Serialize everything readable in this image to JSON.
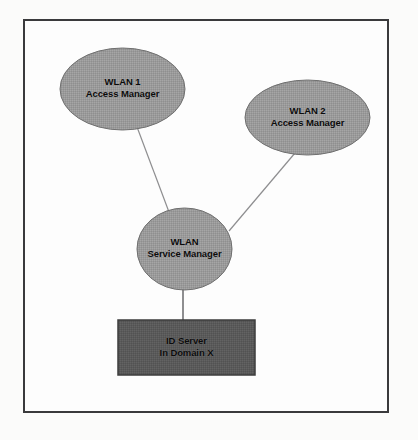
{
  "diagram": {
    "frame": {
      "border_color": "#3a3a3c",
      "background": "#fdfdfd"
    },
    "palette": {
      "ellipse_fill": "#9a9a9a",
      "ellipse_stroke": "#6f6f6f",
      "rect_fill": "#5a5a5a",
      "rect_stroke": "#3d3d3d",
      "connector": "#8e8e90",
      "text": "#0b0b0b"
    },
    "nodes": [
      {
        "id": "wlan1-access-manager",
        "shape": "ellipse",
        "line1": "WLAN 1",
        "line2": "Access Manager",
        "cx": 122.5,
        "cy": 89,
        "rx": 62.5,
        "ry": 41,
        "fill": "#9a9a9a"
      },
      {
        "id": "wlan2-access-manager",
        "shape": "ellipse",
        "line1": "WLAN 2",
        "line2": "Access Manager",
        "cx": 307.5,
        "cy": 117.5,
        "rx": 62.5,
        "ry": 37.5,
        "fill": "#9a9a9a"
      },
      {
        "id": "wlan-service-manager",
        "shape": "circle",
        "line1": "WLAN",
        "line2": "Service Manager",
        "cx": 184.5,
        "cy": 249,
        "rx": 47.5,
        "ry": 41,
        "fill": "#9a9a9a"
      },
      {
        "id": "id-server-domain-x",
        "shape": "rectangle",
        "line1": "ID Server",
        "line2": "In Domain X",
        "x": 118,
        "y": 320,
        "width": 137,
        "height": 55,
        "fill": "#5a5a5a"
      }
    ],
    "connectors": [
      {
        "id": "wlan1-to-service-manager",
        "from": "wlan1-access-manager",
        "to": "wlan-service-manager",
        "x1": 137,
        "y1": 127,
        "x2": 169,
        "y2": 212
      },
      {
        "id": "wlan2-to-service-manager",
        "from": "wlan2-access-manager",
        "to": "wlan-service-manager",
        "x1": 295,
        "y1": 153,
        "x2": 229,
        "y2": 231
      },
      {
        "id": "service-manager-to-id-server",
        "from": "wlan-service-manager",
        "to": "id-server-domain-x",
        "x1": 183,
        "y1": 290,
        "x2": 183,
        "y2": 321
      }
    ]
  }
}
